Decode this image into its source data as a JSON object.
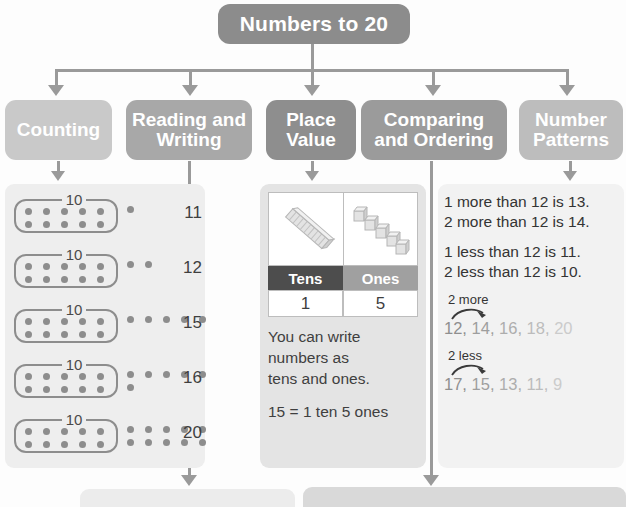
{
  "title": {
    "text": "Numbers to 20"
  },
  "categories": [
    {
      "id": "counting",
      "label": "Counting",
      "color": "#c9c9c9"
    },
    {
      "id": "reading-and-writing",
      "label": "Reading and Writing",
      "color": "#a8a8a8"
    },
    {
      "id": "place-value",
      "label": "Place Value",
      "color": "#8e8e8e"
    },
    {
      "id": "comparing-and-ordering",
      "label": "Comparing and Ordering",
      "color": "#9b9b9b"
    },
    {
      "id": "number-patterns",
      "label": "Number Patterns",
      "color": "#bdbdbd"
    }
  ],
  "counting": {
    "ten_label": "10",
    "rows": [
      {
        "total": "11",
        "ten_dots": 10,
        "extra_dots": 1
      },
      {
        "total": "12",
        "ten_dots": 10,
        "extra_dots": 2
      },
      {
        "total": "15",
        "ten_dots": 10,
        "extra_dots": 5
      },
      {
        "total": "16",
        "ten_dots": 10,
        "extra_dots": 6
      },
      {
        "total": "20",
        "ten_dots": 10,
        "extra_dots": 10
      }
    ]
  },
  "place_value": {
    "picture_tens_cubes": 10,
    "picture_ones_cubes": 5,
    "header_tens": "Tens",
    "header_ones": "Ones",
    "value_tens": "1",
    "value_ones": "5",
    "header_tens_color": "#4d4d4d",
    "header_ones_color": "#a0a0a0",
    "text_line1": "You can write",
    "text_line2": "numbers as",
    "text_line3": "tens and ones.",
    "equation": "15 = 1 ten 5 ones"
  },
  "comparing": {
    "more_line1": "1 more than 12 is 13.",
    "more_line2": "2 more than 12 is 14.",
    "less_line1": "1 less than 12 is 11.",
    "less_line2": "2 less than 12 is 10.",
    "pattern_more_label": "2 more",
    "pattern_more_numbers": [
      "12",
      "14",
      "16",
      "18",
      "20"
    ],
    "pattern_less_label": "2 less",
    "pattern_less_numbers": [
      "17",
      "15",
      "13",
      "11",
      "9"
    ]
  },
  "bottom_boxes": [
    {
      "id": "bottom-left-box",
      "color": "#ececec"
    },
    {
      "id": "bottom-right-box",
      "color": "#d9d9d9"
    }
  ]
}
